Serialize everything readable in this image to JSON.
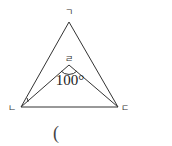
{
  "diagram": {
    "type": "geometry-triangle",
    "vertices": {
      "top": {
        "label": "ㄱ"
      },
      "left": {
        "label": "ㄴ"
      },
      "right": {
        "label": "ㄷ"
      },
      "inner": {
        "label": "ㄹ"
      }
    },
    "angle_label": "100°",
    "answer_paren": "(",
    "stroke_color": "#333333"
  }
}
